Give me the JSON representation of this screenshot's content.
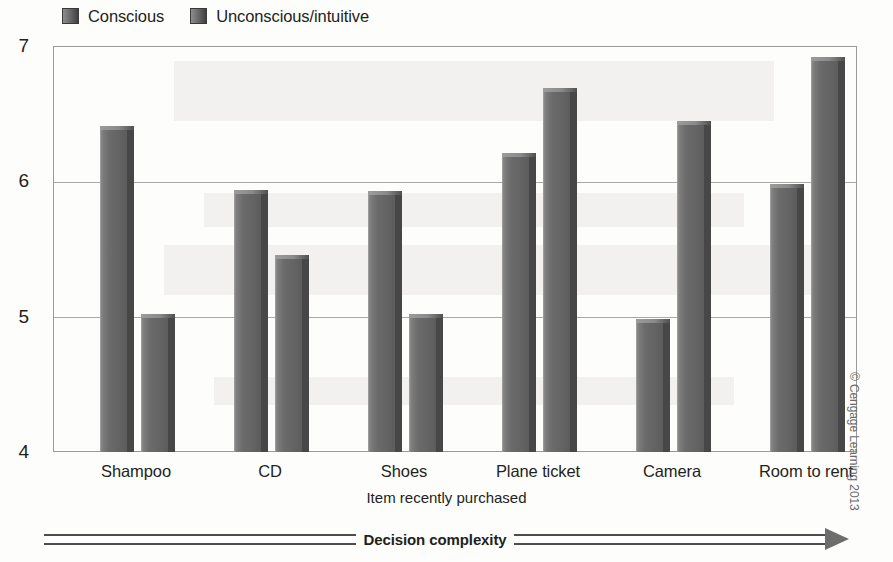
{
  "chart_data": {
    "type": "bar",
    "title": "",
    "xlabel": "Item recently purchased",
    "ylabel": "Mean rating of satisfaction",
    "ylim": [
      4,
      7
    ],
    "yticks": [
      4,
      5,
      6,
      7
    ],
    "grid": true,
    "legend_position": "top-left",
    "categories": [
      "Shampoo",
      "CD",
      "Shoes",
      "Plane ticket",
      "Camera",
      "Room to rent"
    ],
    "series": [
      {
        "name": "Conscious",
        "values": [
          6.38,
          5.91,
          5.9,
          6.18,
          4.95,
          5.95
        ],
        "color": "#6b6b6b"
      },
      {
        "name": "Unconscious/intuitive",
        "values": [
          4.99,
          5.43,
          4.99,
          6.66,
          6.42,
          6.89
        ],
        "color": "#6b6b6b"
      }
    ],
    "annotations": [
      {
        "name": "decision-complexity-arrow",
        "text": "Decision complexity",
        "direction": "right"
      }
    ],
    "credit": "© Cengage Learning 2013"
  },
  "legend": {
    "entries": [
      {
        "label": "Conscious"
      },
      {
        "label": "Unconscious/intuitive"
      }
    ]
  },
  "axes": {
    "y_title": "Mean rating of satisfaction",
    "x_title": "Item recently purchased",
    "y_ticks": [
      "7",
      "6",
      "5",
      "4"
    ],
    "x_ticks": [
      "Shampoo",
      "CD",
      "Shoes",
      "Plane ticket",
      "Camera",
      "Room to rent"
    ]
  },
  "footer": {
    "arrow_label": "Decision complexity",
    "credit": "© Cengage Learning 2013"
  }
}
